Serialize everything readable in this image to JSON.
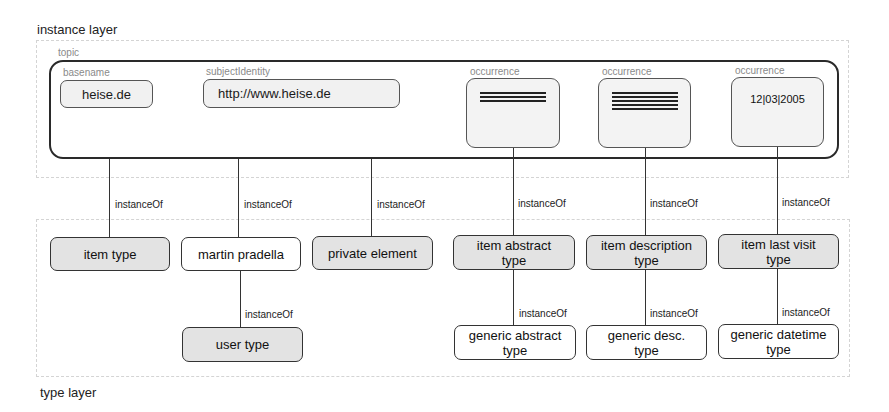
{
  "instance_layer": {
    "label": "instance layer",
    "topic": {
      "label": "topic",
      "basename": {
        "label": "basename",
        "value": "heise.de"
      },
      "subject_identity": {
        "label": "subjectIdentity",
        "value": "http://www.heise.de"
      },
      "occurrences": [
        {
          "label": "occurrence",
          "content": "text-lines-3",
          "lines": 3
        },
        {
          "label": "occurrence",
          "content": "text-lines-5",
          "lines": 5
        },
        {
          "label": "occurrence",
          "content": "date",
          "value": "12|03|2005"
        }
      ]
    }
  },
  "type_layer": {
    "label": "type layer",
    "nodes": [
      {
        "id": "item-type",
        "label": "item type",
        "fill": "grey"
      },
      {
        "id": "martin-pradella",
        "label": "martin pradella",
        "fill": "white"
      },
      {
        "id": "private-element",
        "label": "private element",
        "fill": "grey"
      },
      {
        "id": "item-abstract-type",
        "label": "item abstract type",
        "fill": "grey"
      },
      {
        "id": "item-description-type",
        "label": "item description type",
        "fill": "grey"
      },
      {
        "id": "item-last-visit-type",
        "label": "item last visit type",
        "fill": "grey"
      },
      {
        "id": "user-type",
        "label": "user type",
        "fill": "grey"
      },
      {
        "id": "generic-abstract-type",
        "label": "generic abstract type",
        "fill": "white"
      },
      {
        "id": "generic-desc-type",
        "label": "generic desc. type",
        "fill": "white"
      },
      {
        "id": "generic-datetime-type",
        "label": "generic datetime type",
        "fill": "white"
      }
    ]
  },
  "edges": {
    "label": "instanceOf",
    "list": [
      {
        "from": "topic",
        "to": "item-type",
        "label": "instanceOf"
      },
      {
        "from": "basename",
        "to": "martin-pradella",
        "label": "instanceOf"
      },
      {
        "from": "topic",
        "to": "private-element",
        "label": "instanceOf"
      },
      {
        "from": "occurrence-1",
        "to": "item-abstract-type",
        "label": "instanceOf"
      },
      {
        "from": "occurrence-2",
        "to": "item-description-type",
        "label": "instanceOf"
      },
      {
        "from": "occurrence-3",
        "to": "item-last-visit-type",
        "label": "instanceOf"
      },
      {
        "from": "martin-pradella",
        "to": "user-type",
        "label": "instanceOf"
      },
      {
        "from": "item-abstract-type",
        "to": "generic-abstract-type",
        "label": "instanceOf"
      },
      {
        "from": "item-description-type",
        "to": "generic-desc-type",
        "label": "instanceOf"
      },
      {
        "from": "item-last-visit-type",
        "to": "generic-datetime-type",
        "label": "instanceOf"
      }
    ]
  }
}
